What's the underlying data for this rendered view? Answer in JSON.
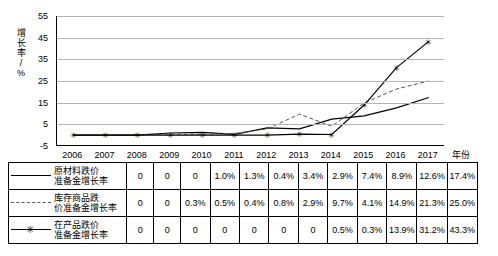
{
  "chart_data": {
    "type": "line",
    "title": "",
    "xlabel": "年份",
    "ylabel": "增长率/%",
    "categories": [
      "2006",
      "2007",
      "2008",
      "2009",
      "2010",
      "2011",
      "2012",
      "2013",
      "2014",
      "2015",
      "2016",
      "2017"
    ],
    "ylim": [
      -5,
      55
    ],
    "yticks": [
      "55",
      "45",
      "35",
      "25",
      "15",
      "5",
      "-5"
    ],
    "grid": true,
    "legend_position": "bottom-table",
    "series": [
      {
        "name": "原材料跌价准备金增长率",
        "values": [
          0,
          0,
          0,
          1.0,
          1.3,
          0.4,
          3.4,
          2.9,
          7.4,
          8.9,
          12.6,
          17.4
        ],
        "labels": [
          "0",
          "0",
          "0",
          "1.0%",
          "1.3%",
          "0.4%",
          "3.4%",
          "2.9%",
          "7.4%",
          "8.9%",
          "12.6%",
          "17.4%"
        ],
        "style": "solid",
        "marker": "none",
        "color": "#000000"
      },
      {
        "name": "库存商品跌价准备金增长率",
        "values": [
          0,
          0,
          0.3,
          0.5,
          0.4,
          0.8,
          2.9,
          9.7,
          4.1,
          14.9,
          21.3,
          25.0
        ],
        "labels": [
          "0",
          "0",
          "0.3%",
          "0.5%",
          "0.4%",
          "0.8%",
          "2.9%",
          "9.7%",
          "4.1%",
          "14.9%",
          "21.3%",
          "25.0%"
        ],
        "style": "dashed",
        "marker": "none",
        "color": "#555555"
      },
      {
        "name": "在产品跌价准备金增长率",
        "values": [
          0,
          0,
          0,
          0,
          0,
          0,
          0,
          0.5,
          0.3,
          13.9,
          31.2,
          43.3
        ],
        "labels": [
          "0",
          "0",
          "0",
          "0",
          "0",
          "0",
          "0",
          "0.5%",
          "0.3%",
          "13.9%",
          "31.2%",
          "43.3%"
        ],
        "style": "solid",
        "marker": "star",
        "color": "#000000"
      }
    ]
  },
  "axis": {
    "y_title_chars": [
      "增",
      "长",
      "率",
      "/",
      "%"
    ],
    "x_title": "年份"
  }
}
